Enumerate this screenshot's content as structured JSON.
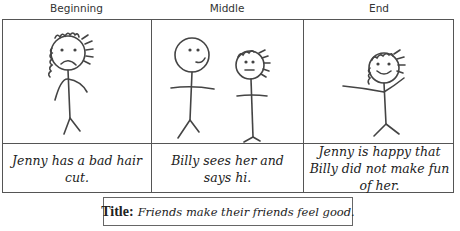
{
  "storyboard": {
    "panels": [
      {
        "heading": "Beginning",
        "caption": "Jenny has a bad hair cut.",
        "figures": [
          "sad-girl-curly-hair"
        ]
      },
      {
        "heading": "Middle",
        "caption": "Billy sees her and says hi.",
        "figures": [
          "smiling-boy",
          "neutral-girl-curly-hair"
        ]
      },
      {
        "heading": "End",
        "caption": "Jenny is happy that Billy did not make fun of her.",
        "figures": [
          "happy-girl-arms-raised"
        ]
      }
    ],
    "title": {
      "label": "Title:",
      "text": "Friends make their friends feel good."
    }
  }
}
